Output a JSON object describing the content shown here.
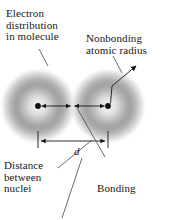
{
  "figure": {
    "background_color": "#ffffff",
    "ink_color": "#161616",
    "cloud_color": "#9a9a9a",
    "labels": {
      "electron_distribution": "Electron\ndistribution\nin molecule",
      "nonbonding_radius": "Nonbonding\natomic radius",
      "distance_between_nuclei": "Distance\nbetween\nnuclei",
      "bonding_radius_line1": "Bonding",
      "bonding_radius_line2": "atomic",
      "bonding_radius_line3": "radius,",
      "bonding_radius_fraction_numerator": "1",
      "bonding_radius_fraction_denominator": "2",
      "bonding_radius_variable": "d",
      "distance_symbol": "d"
    },
    "diagram_data": {
      "type": "scientific-diagram",
      "atoms": [
        {
          "name": "left-atom",
          "nucleus_x": 38,
          "nucleus_y": 106,
          "cloud_radius": 36
        },
        {
          "name": "right-atom",
          "nucleus_x": 108,
          "nucleus_y": 106,
          "cloud_radius": 36
        }
      ],
      "internuclear_distance_label": "d",
      "bonding_radius_value": "1/2 d",
      "measurements": [
        {
          "name": "internuclear-distance",
          "symbol": "d",
          "from_x": 38,
          "to_x": 108,
          "y": 140
        },
        {
          "name": "left-half-radius",
          "from_x": 38,
          "to_x": 73,
          "y": 106
        },
        {
          "name": "right-half-radius",
          "from_x": 73,
          "to_x": 108,
          "y": 106
        },
        {
          "name": "nonbonding-radius-arrow",
          "from_x": 112,
          "from_y": 104,
          "to_x": 138,
          "to_y": 68
        }
      ]
    }
  }
}
